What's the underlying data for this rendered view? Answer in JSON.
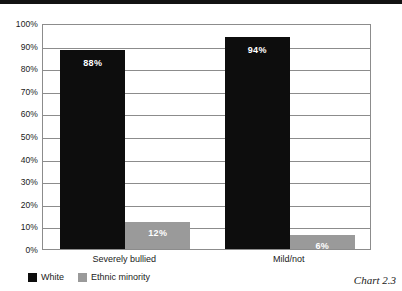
{
  "chart_data": {
    "type": "bar",
    "title": "",
    "xlabel": "",
    "ylabel": "",
    "categories": [
      "Severely bullied",
      "Mild/not"
    ],
    "series": [
      {
        "name": "White",
        "values": [
          88,
          94
        ],
        "color": "#0d0d0d",
        "labels": [
          "88%",
          "6%"
        ]
      },
      {
        "name": "Ethnic minority",
        "values": [
          12,
          6
        ],
        "color": "#9a9a9a",
        "labels": [
          "12%",
          "6%"
        ]
      }
    ],
    "value_labels": [
      [
        "88%",
        "12%"
      ],
      [
        "94%",
        "6%"
      ]
    ],
    "ylim": [
      0,
      100
    ],
    "y_ticks": [
      0,
      10,
      20,
      30,
      40,
      50,
      60,
      70,
      80,
      90,
      100
    ],
    "y_tick_labels": [
      "0%",
      "10%",
      "20%",
      "30%",
      "40%",
      "50%",
      "60%",
      "70%",
      "80%",
      "90%",
      "100%"
    ],
    "grid": true,
    "legend_position": "bottom-left"
  },
  "legend": {
    "items": [
      {
        "label": "White",
        "color": "#0d0d0d"
      },
      {
        "label": "Ethnic minority",
        "color": "#9a9a9a"
      }
    ]
  },
  "caption": "Chart 2.3"
}
